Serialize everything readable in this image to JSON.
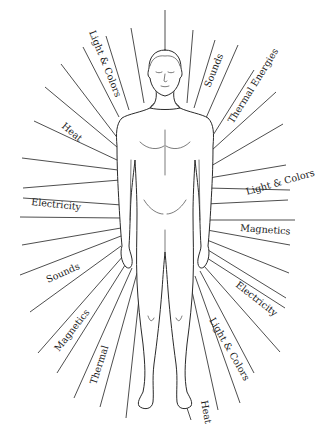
{
  "diagram": {
    "type": "human-body-energy-rays",
    "background": "#ffffff",
    "line_color": "#3a3a3a",
    "labels": [
      {
        "id": "light-colors-top-left",
        "text": "Light & Colors",
        "x": 103,
        "y": 12,
        "rotate": 68
      },
      {
        "id": "sounds-top-right",
        "text": "Sounds",
        "x": 212,
        "y": 86,
        "rotate": -68
      },
      {
        "id": "thermal-energies",
        "text": "Thermal Energies",
        "x": 232,
        "y": 123,
        "rotate": -58
      },
      {
        "id": "heat-left",
        "text": "Heat",
        "x": 62,
        "y": 128,
        "rotate": 38
      },
      {
        "id": "light-colors-right",
        "text": "Light & Colors",
        "x": 245,
        "y": 193,
        "rotate": -17
      },
      {
        "id": "electricity-left",
        "text": "Electricity",
        "x": 31,
        "y": 208,
        "rotate": 7
      },
      {
        "id": "magnetics-right",
        "text": "Magnetics",
        "x": 240,
        "y": 228,
        "rotate": 4
      },
      {
        "id": "sounds-left",
        "text": "Sounds",
        "x": 46,
        "y": 283,
        "rotate": -24
      },
      {
        "id": "electricity-right",
        "text": "Electricity",
        "x": 234,
        "y": 287,
        "rotate": 38
      },
      {
        "id": "magnetics-left",
        "text": "Magnetics",
        "x": 58,
        "y": 353,
        "rotate": -50
      },
      {
        "id": "light-colors-bottom-right",
        "text": "Light & Colors",
        "x": 210,
        "y": 320,
        "rotate": 62
      },
      {
        "id": "thermal-bottom",
        "text": "Thermal",
        "x": 95,
        "y": 387,
        "rotate": -72
      },
      {
        "id": "heat-bottom",
        "text": "Heat",
        "x": 199,
        "y": 403,
        "rotate": 80
      }
    ]
  }
}
